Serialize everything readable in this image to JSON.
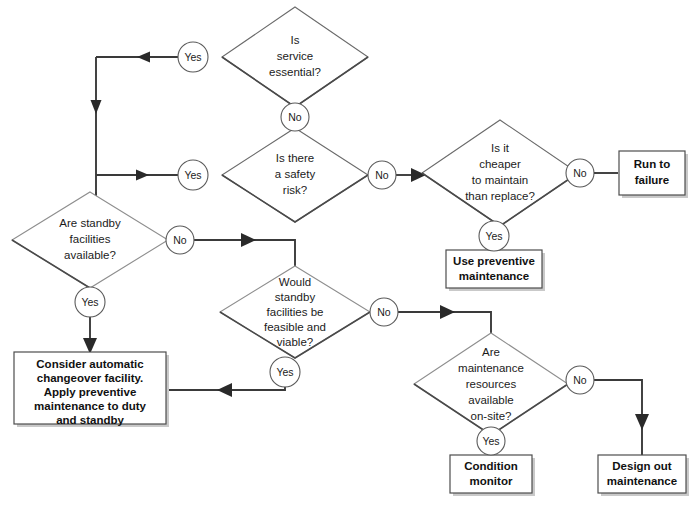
{
  "diagram": {
    "background_color": "#ffffff",
    "line_color": "#3a3a3a",
    "shape_fill": "#ffffff",
    "shape_stroke": "#6a6a6a",
    "text_color": "#1b1b1b"
  },
  "decisions": [
    {
      "id": "service-essential",
      "lines": [
        "Is",
        "service",
        "essential?"
      ],
      "cx": 295,
      "cy": 57,
      "rx": 73,
      "ry": 50
    },
    {
      "id": "safety-risk",
      "lines": [
        "Is there",
        "a safety",
        "risk?"
      ],
      "cx": 295,
      "cy": 175,
      "rx": 73,
      "ry": 47
    },
    {
      "id": "cheaper-maintain",
      "lines": [
        "Is it",
        "cheaper",
        "to maintain",
        "than replace?"
      ],
      "cx": 500,
      "cy": 173,
      "rx": 78,
      "ry": 53
    },
    {
      "id": "standby-available",
      "lines": [
        "Are standby",
        "facilities",
        "available?"
      ],
      "cx": 87,
      "cy": 240,
      "rx": 78,
      "ry": 48
    },
    {
      "id": "standby-feasible",
      "lines": [
        "Would",
        "standby",
        "facilities be",
        "feasible and",
        "viable?"
      ],
      "cx": 295,
      "cy": 312,
      "rx": 75,
      "ry": 47
    },
    {
      "id": "maintenance-resources",
      "lines": [
        "Are",
        "maintenance",
        "resources",
        "available",
        "on-site?"
      ],
      "cx": 491,
      "cy": 384,
      "rx": 77,
      "ry": 52
    }
  ],
  "terminals": [
    {
      "id": "run-to-failure",
      "lines": [
        "Run to",
        "failure"
      ],
      "x": 619,
      "y": 151,
      "w": 66,
      "h": 44
    },
    {
      "id": "use-preventive-maintenance",
      "lines": [
        "Use preventive",
        "maintenance"
      ],
      "x": 446,
      "y": 250,
      "w": 96,
      "h": 38
    },
    {
      "id": "consider-automatic-changeover",
      "lines": [
        "Consider automatic",
        "changeover facility.",
        "Apply preventive",
        "maintenance to duty",
        "and standby"
      ],
      "x": 14,
      "y": 352,
      "w": 152,
      "h": 72
    },
    {
      "id": "condition-monitor",
      "lines": [
        "Condition",
        "monitor"
      ],
      "x": 450,
      "y": 455,
      "w": 82,
      "h": 38
    },
    {
      "id": "design-out-maintenance",
      "lines": [
        "Design out",
        "maintenance"
      ],
      "x": 598,
      "y": 455,
      "w": 88,
      "h": 38
    }
  ],
  "edge_labels": [
    {
      "id": "label-service-essential-yes",
      "text": "Yes",
      "cx": 193,
      "cy": 57
    },
    {
      "id": "label-service-essential-no",
      "text": "No",
      "cx": 295,
      "cy": 115
    },
    {
      "id": "label-safety-risk-yes",
      "text": "Yes",
      "cx": 193,
      "cy": 175
    },
    {
      "id": "label-safety-risk-no",
      "text": "No",
      "cx": 382,
      "cy": 175
    },
    {
      "id": "label-cheaper-no",
      "text": "No",
      "cx": 580,
      "cy": 173
    },
    {
      "id": "label-cheaper-yes",
      "text": "Yes",
      "cx": 500,
      "cy": 233
    },
    {
      "id": "label-standby-available-no",
      "text": "No",
      "cx": 179,
      "cy": 240
    },
    {
      "id": "label-standby-available-yes",
      "text": "Yes",
      "cx": 87,
      "cy": 303
    },
    {
      "id": "label-standby-feasible-no",
      "text": "No",
      "cx": 384,
      "cy": 312
    },
    {
      "id": "label-standby-feasible-yes",
      "text": "Yes",
      "cx": 285,
      "cy": 372
    },
    {
      "id": "label-resources-no",
      "text": "No",
      "cx": 580,
      "cy": 380
    },
    {
      "id": "label-resources-yes",
      "text": "Yes",
      "cx": 491,
      "cy": 440
    }
  ],
  "connectors": [
    {
      "id": "conn-essential-yes-to-safety",
      "path": "M 178 57 L 95 57 L 95 175 L 178 175",
      "arrows": [
        "left-at-140-57",
        "down-at-95-112",
        "right-at-140-175"
      ]
    },
    {
      "id": "conn-essential-no-to-safety",
      "path": "M 295 107 L 295 128"
    },
    {
      "id": "conn-safety-rail-to-standby",
      "path": "M 95 175 L 95 200"
    },
    {
      "id": "conn-safety-no-to-cheaper",
      "path": "M 395 175 L 422 175",
      "arrows": [
        "right-at-420-175"
      ]
    },
    {
      "id": "conn-cheaper-no-to-run",
      "path": "M 593 173 L 619 173",
      "arrows": [
        "right-at-617-173"
      ]
    },
    {
      "id": "conn-cheaper-yes-to-preventive",
      "path": "M 500 245 L 500 250"
    },
    {
      "id": "conn-standby-no-to-feasible",
      "path": "M 192 240 L 295 240 L 295 266",
      "arrows": [
        "right-at-250-240"
      ]
    },
    {
      "id": "conn-standby-yes-to-consider",
      "path": "M 87 315 L 87 352",
      "arrows": [
        "down-at-87-350"
      ]
    },
    {
      "id": "conn-feasible-yes-to-consider",
      "path": "M 285 384 L 166 384",
      "arrows": [
        "left-at-230-384"
      ]
    },
    {
      "id": "conn-feasible-no-to-resources",
      "path": "M 397 312 L 491 312 L 491 333",
      "arrows": [
        "right-at-455-312"
      ]
    },
    {
      "id": "conn-resources-yes-to-condition",
      "path": "M 491 452 L 491 455"
    },
    {
      "id": "conn-resources-no-to-design",
      "path": "M 593 380 L 642 380 L 642 455",
      "arrows": [
        "down-at-642-428"
      ]
    },
    {
      "id": "conn-consider-to-feasible-rail",
      "path": "M 166 384 L 166 384"
    }
  ]
}
